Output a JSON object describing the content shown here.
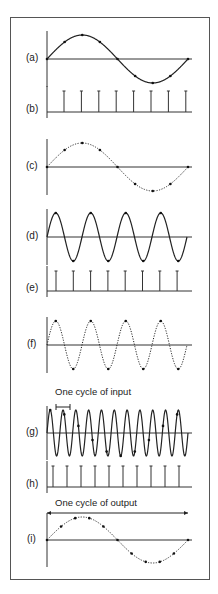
{
  "labels": [
    "(a)",
    "(b)",
    "(c)",
    "(d)",
    "(e)",
    "(f)",
    "(g)",
    "(h)",
    "(i)"
  ],
  "annotations": {
    "input_cycle": "One cycle of input",
    "output_cycle": "One cycle of output"
  },
  "panels": [
    {
      "id": "a",
      "type": "sine",
      "style": "solid",
      "cycles": 1,
      "dots": 8,
      "axis_y": 59,
      "amp": 24
    },
    {
      "id": "b",
      "type": "pulses",
      "count": 8,
      "baseline_y": 112,
      "top_y": 91,
      "x_start": 64,
      "x_step": 17.4
    },
    {
      "id": "c",
      "type": "sine",
      "style": "dotted",
      "cycles": 1,
      "dots": 8,
      "axis_y": 167,
      "amp": 24
    },
    {
      "id": "d",
      "type": "sine",
      "style": "solid",
      "cycles": 4,
      "dots": 8,
      "axis_y": 237,
      "amp": 24
    },
    {
      "id": "e",
      "type": "pulses",
      "count": 8,
      "baseline_y": 291,
      "top_y": 271,
      "x_start": 56,
      "x_step": 17.3
    },
    {
      "id": "f",
      "type": "sine",
      "style": "dotted",
      "cycles": 4,
      "dots": 8,
      "axis_y": 345,
      "amp": 24
    },
    {
      "id": "g",
      "type": "sine",
      "style": "solid",
      "cycles": 11,
      "dots": 10,
      "axis_y": 433,
      "amp": 23
    },
    {
      "id": "h",
      "type": "pulses",
      "count": 10,
      "baseline_y": 487,
      "top_y": 466,
      "x_start": 53,
      "x_step": 14
    },
    {
      "id": "i",
      "type": "sine",
      "style": "dotted",
      "cycles": 1,
      "dots": 10,
      "axis_y": 540,
      "amp": 23
    }
  ]
}
